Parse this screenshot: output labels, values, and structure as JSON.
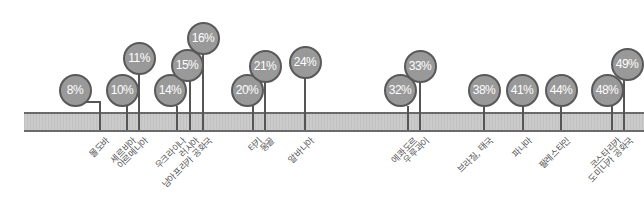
{
  "chart_data": {
    "type": "lollipop-timeline",
    "title": "",
    "xlabel": "",
    "ylabel": "",
    "unit": "%",
    "colors": {
      "bubble_fill": "#999999",
      "bubble_border": "#595959",
      "bubble_text": "#ffffff",
      "bar_fill": "#cbcbcb",
      "bar_border": "#6a6a6a",
      "stem": "#555555",
      "label": "#555555"
    },
    "points": [
      {
        "value": 8,
        "text": "8%",
        "label": "몰도바",
        "cx": 75,
        "cy": 90,
        "stem_x": 100
      },
      {
        "value": 10,
        "text": "10%",
        "label": "세르비아",
        "cx": 122,
        "cy": 90,
        "stem_x": 127
      },
      {
        "value": 11,
        "text": "11%",
        "label": "아르메니아",
        "cx": 139,
        "cy": 58,
        "stem_x": 139
      },
      {
        "value": 14,
        "text": "14%",
        "label": "우크라이나",
        "cx": 170,
        "cy": 90,
        "stem_x": 177
      },
      {
        "value": 15,
        "text": "15%",
        "label": "러시아",
        "cx": 187,
        "cy": 65,
        "stem_x": 190
      },
      {
        "value": 16,
        "text": "16%",
        "label": "남아프리카 공화국",
        "cx": 203,
        "cy": 38,
        "stem_x": 203
      },
      {
        "value": 20,
        "text": "20%",
        "label": "터키",
        "cx": 247,
        "cy": 90,
        "stem_x": 253
      },
      {
        "value": 21,
        "text": "21%",
        "label": "몽골",
        "cx": 265,
        "cy": 66,
        "stem_x": 265
      },
      {
        "value": 24,
        "text": "24%",
        "label": "알바니아",
        "cx": 305,
        "cy": 62,
        "stem_x": 305
      },
      {
        "value": 32,
        "text": "32%",
        "label": "에콰도르",
        "cx": 400,
        "cy": 90,
        "stem_x": 408
      },
      {
        "value": 33,
        "text": "33%",
        "label": "우루과이",
        "cx": 420,
        "cy": 66,
        "stem_x": 420
      },
      {
        "value": 38,
        "text": "38%",
        "label": "브라질, 태국",
        "cx": 484,
        "cy": 90,
        "stem_x": 484
      },
      {
        "value": 41,
        "text": "41%",
        "label": "파나마",
        "cx": 522,
        "cy": 90,
        "stem_x": 523
      },
      {
        "value": 44,
        "text": "44%",
        "label": "팔레스타인",
        "cx": 561,
        "cy": 90,
        "stem_x": 561
      },
      {
        "value": 48,
        "text": "48%",
        "label": "코스타리카",
        "cx": 607,
        "cy": 90,
        "stem_x": 612
      },
      {
        "value": 49,
        "text": "49%",
        "label": "도미니카 공화국",
        "cx": 627,
        "cy": 64,
        "stem_x": 624
      }
    ],
    "legend": null,
    "grid": false
  }
}
